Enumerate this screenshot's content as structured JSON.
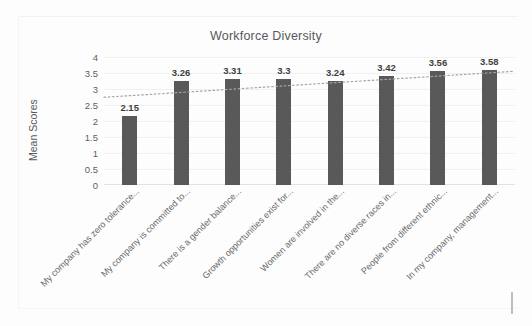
{
  "chart_data": {
    "type": "bar",
    "title": "Workforce Diversity",
    "xlabel": "",
    "ylabel": "Mean Scores",
    "ylim": [
      0,
      4
    ],
    "y_ticks": [
      "0",
      "0.5",
      "1",
      "1.5",
      "2",
      "2.5",
      "3",
      "3.5",
      "4"
    ],
    "grid": true,
    "legend": "none",
    "bar_color": "#595959",
    "trendline": {
      "type": "linear-dotted",
      "color": "#a6a6a6",
      "start_value": 2.74,
      "end_value": 3.55
    },
    "categories": [
      "My company has zero tolerance...",
      "My company is committed to...",
      "There is a gender balance...",
      "Growth opportunities exist for...",
      "Women are involved in the...",
      "There are no diverse races in...",
      "People from different ethnic...",
      "In my company, management..."
    ],
    "values": [
      2.15,
      3.26,
      3.31,
      3.3,
      3.24,
      3.42,
      3.56,
      3.58
    ],
    "value_labels": [
      "2.15",
      "3.26",
      "3.31",
      "3.3",
      "3.24",
      "3.42",
      "3.56",
      "3.58"
    ]
  }
}
